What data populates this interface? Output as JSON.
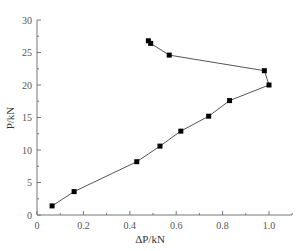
{
  "chart_data": {
    "type": "line",
    "title": "",
    "xlabel": "ΔP/kN",
    "ylabel": "P/kN",
    "xlim": [
      0,
      1.1
    ],
    "ylim": [
      0,
      30
    ],
    "xticks": [
      "0",
      "0.2",
      "0.4",
      "0.6",
      "0.8",
      "1.0"
    ],
    "yticks": [
      "0",
      "5",
      "10",
      "15",
      "20",
      "25",
      "30"
    ],
    "grid": false,
    "legend": null,
    "series": [
      {
        "name": "P vs ΔP",
        "marker": "square",
        "color": "#000000",
        "line_color": "#555555",
        "x": [
          0.065,
          0.16,
          0.43,
          0.53,
          0.62,
          0.74,
          0.83,
          1.0,
          0.98,
          0.57,
          0.49,
          0.48
        ],
        "y": [
          1.4,
          3.6,
          8.2,
          10.6,
          12.9,
          15.2,
          17.6,
          20.0,
          22.2,
          24.6,
          26.4,
          26.8
        ]
      }
    ]
  }
}
